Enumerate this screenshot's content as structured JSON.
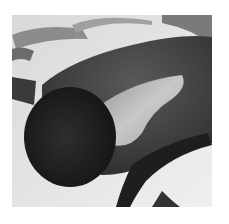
{
  "image": {
    "kind": "photograph",
    "description": "Close-up photo of a dark, rounded leathery object with a pale whitish patch on its upper surface, lying on a light background with metal straps and a dark curved strap/handle visible behind and beside it",
    "colors": {
      "background": "#ffffff",
      "photo_backdrop": "#e9e9e9",
      "object_dark": "#2a2a2a",
      "object_mid": "#4a4a4a",
      "pale_patch": "#cfcfcf",
      "metal_strap": "#8f8f8f"
    }
  }
}
